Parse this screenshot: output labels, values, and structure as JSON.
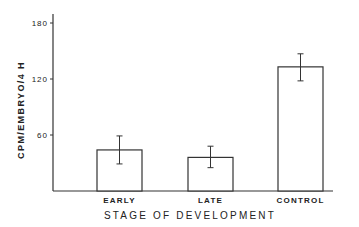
{
  "chart_data": {
    "type": "bar",
    "title": "",
    "xlabel": "STAGE OF DEVELOPMENT",
    "ylabel": "CPM/EMBRYO/4 H",
    "categories": [
      "EARLY",
      "LATE",
      "CONTROL"
    ],
    "values": [
      44,
      36,
      133
    ],
    "error_bars": [
      {
        "low": 29,
        "high": 59
      },
      {
        "low": 25,
        "high": 48
      },
      {
        "low": 118,
        "high": 147
      }
    ],
    "yticks": [
      60,
      120,
      180
    ],
    "ytick_labels": [
      "60",
      "120",
      "180"
    ],
    "ylim": [
      0,
      180
    ],
    "grid": false,
    "legend": null,
    "bar_fill": "#ffffff",
    "bar_stroke": "#333333"
  }
}
